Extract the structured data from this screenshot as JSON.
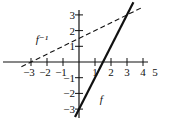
{
  "chart_data": {
    "type": "line",
    "title": "",
    "xlabel": "",
    "ylabel": "",
    "xlim": [
      -3.5,
      5
    ],
    "ylim": [
      -3.4,
      3.4
    ],
    "grid": false,
    "xticks": [
      -3,
      -2,
      -1,
      1,
      2,
      3,
      4,
      5
    ],
    "yticks": [
      -3,
      -2,
      -1,
      1,
      2,
      3
    ],
    "xtick_labels": [
      "−3",
      "−2",
      "−1",
      "1",
      "2",
      "3",
      "4",
      "5"
    ],
    "ytick_labels": [
      "−3",
      "−2",
      "−1",
      "1",
      "2",
      "3"
    ],
    "series": [
      {
        "name": "f",
        "label": "f",
        "style": "solid",
        "equation": "y = 2x - 3",
        "x": [
          -0.25,
          3.4
        ],
        "y": [
          -3.5,
          3.8
        ]
      },
      {
        "name": "f^-1",
        "label": "f⁻¹",
        "style": "dashed",
        "equation": "y = (x + 3) / 2",
        "x": [
          -3.6,
          4.0
        ],
        "y": [
          -0.3,
          3.5
        ]
      }
    ],
    "annotations": [
      {
        "text": "f",
        "x": 1.3,
        "y": -2.6
      },
      {
        "text": "f⁻¹",
        "x": -2.7,
        "y": 1.2
      }
    ],
    "colors": {
      "line": "#111111",
      "axis": "#111111"
    }
  }
}
